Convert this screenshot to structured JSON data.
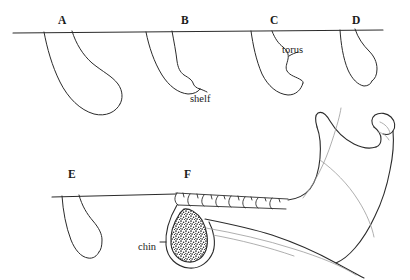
{
  "figure": {
    "ink_color": "#2b2b2b",
    "background_color": "#ffffff",
    "stipple_color": "#1a1a1a"
  },
  "panels": [
    {
      "id": "A",
      "letter": "A",
      "x": 58,
      "y": 14,
      "row": "top",
      "description": "long tapering symphysis profile"
    },
    {
      "id": "B",
      "letter": "B",
      "x": 181,
      "y": 14,
      "row": "top",
      "description": "symphysis with basal shelf"
    },
    {
      "id": "C",
      "letter": "C",
      "x": 270,
      "y": 14,
      "row": "top",
      "description": "symphysis with torus"
    },
    {
      "id": "D",
      "letter": "D",
      "x": 352,
      "y": 14,
      "row": "top",
      "description": "short narrow symphysis"
    },
    {
      "id": "E",
      "letter": "E",
      "x": 68,
      "y": 168,
      "row": "bottom",
      "description": "narrow elongated symphysis"
    },
    {
      "id": "F",
      "letter": "F",
      "x": 184,
      "y": 168,
      "row": "bottom",
      "description": "mandible with stippled chin cross-section"
    }
  ],
  "feature_labels": [
    {
      "id": "shelf",
      "text": "shelf",
      "x": 190,
      "y": 93,
      "points_to": "B"
    },
    {
      "id": "torus",
      "text": "torus",
      "x": 282,
      "y": 44,
      "points_to": "C"
    },
    {
      "id": "chin",
      "text": "chin",
      "x": 138,
      "y": 241,
      "points_to": "F"
    }
  ],
  "reference_lines": [
    {
      "id": "upper-occlusal-line",
      "x1": 13,
      "y1": 33,
      "x2": 383,
      "y2": 30
    },
    {
      "id": "lower-occlusal-line",
      "x1": 52,
      "y1": 197,
      "x2": 176,
      "y2": 194
    }
  ],
  "mandible": {
    "teeth_count": 8,
    "parts": [
      "coronoid-process",
      "condyle",
      "ramus",
      "body",
      "gonial-angle",
      "tooth-row",
      "chin-cross-section"
    ]
  }
}
